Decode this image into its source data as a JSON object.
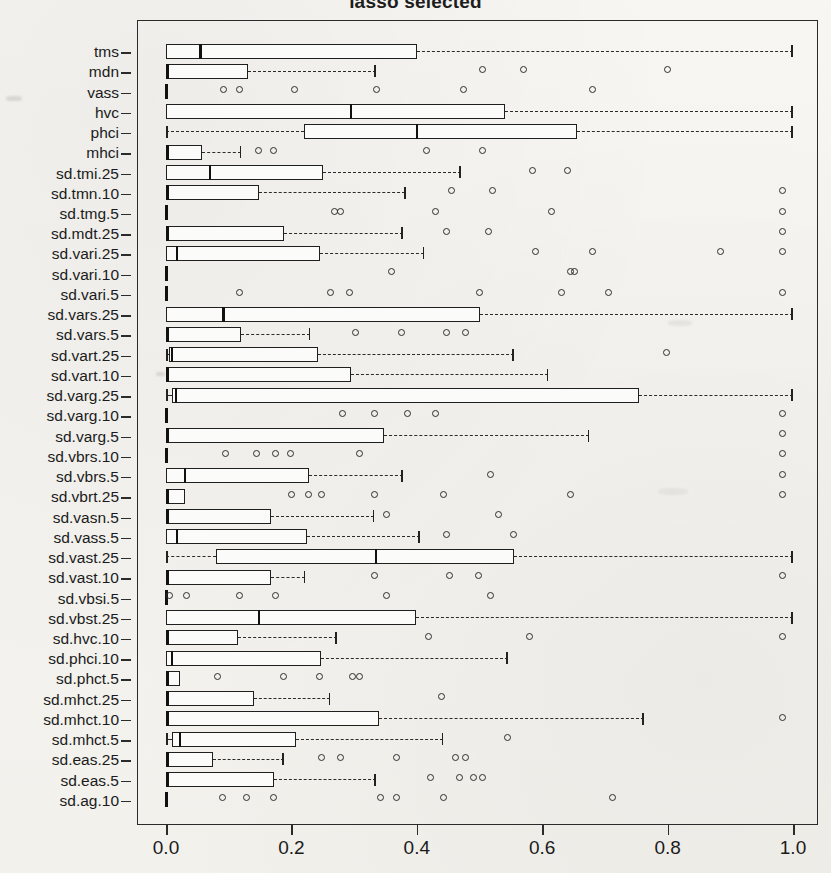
{
  "chart_data": {
    "type": "boxplot",
    "title": "lasso selected",
    "xlabel": "",
    "ylabel": "",
    "xlim": [
      0.0,
      1.0
    ],
    "xticks": [
      0.0,
      0.2,
      0.4,
      0.6,
      0.8,
      1.0
    ],
    "xticklabels": [
      "0.0",
      "0.2",
      "0.4",
      "0.6",
      "0.8",
      "1.0"
    ],
    "orientation": "horizontal",
    "grid": false,
    "legend": null,
    "categories": [
      "tms",
      "mdn",
      "vass",
      "hvc",
      "phci",
      "mhci",
      "sd.tmi.25",
      "sd.tmn.10",
      "sd.tmg.5",
      "sd.mdt.25",
      "sd.vari.25",
      "sd.vari.10",
      "sd.vari.5",
      "sd.vars.25",
      "sd.vars.5",
      "sd.vart.25",
      "sd.vart.10",
      "sd.varg.25",
      "sd.varg.10",
      "sd.varg.5",
      "sd.vbrs.10",
      "sd.vbrs.5",
      "sd.vbrt.25",
      "sd.vasn.5",
      "sd.vass.5",
      "sd.vast.25",
      "sd.vast.10",
      "sd.vbsi.5",
      "sd.vbst.25",
      "sd.hvc.10",
      "sd.phci.10",
      "sd.phct.5",
      "sd.mhct.25",
      "sd.mhct.10",
      "sd.mhct.5",
      "sd.eas.25",
      "sd.eas.5",
      "sd.ag.10"
    ],
    "boxes": [
      {
        "label": "tms",
        "whisker_low": 0.0,
        "q1": 0.0,
        "median": 0.055,
        "q3": 0.4,
        "whisker_high": 1.0,
        "outliers": []
      },
      {
        "label": "mdn",
        "whisker_low": 0.0,
        "q1": 0.0,
        "median": 0.002,
        "q3": 0.13,
        "whisker_high": 0.335,
        "outliers": [
          0.505,
          0.57,
          0.8
        ]
      },
      {
        "label": "vass",
        "whisker_low": 0.0,
        "q1": 0.0,
        "median": 0.0,
        "q3": 0.0,
        "whisker_high": 0.0,
        "outliers": [
          0.092,
          0.118,
          0.205,
          0.335,
          0.475,
          0.68
        ]
      },
      {
        "label": "hvc",
        "whisker_low": 0.0,
        "q1": 0.0,
        "median": 0.295,
        "q3": 0.54,
        "whisker_high": 1.0,
        "outliers": []
      },
      {
        "label": "phci",
        "whisker_low": 0.0,
        "q1": 0.22,
        "median": 0.4,
        "q3": 0.655,
        "whisker_high": 1.0,
        "outliers": []
      },
      {
        "label": "mhci",
        "whisker_low": 0.0,
        "q1": 0.0,
        "median": 0.0,
        "q3": 0.058,
        "whisker_high": 0.12,
        "outliers": [
          0.148,
          0.172,
          0.415,
          0.505
        ]
      },
      {
        "label": "sd.tmi.25",
        "whisker_low": 0.0,
        "q1": 0.0,
        "median": 0.07,
        "q3": 0.25,
        "whisker_high": 0.47,
        "outliers": [
          0.585,
          0.64
        ]
      },
      {
        "label": "sd.tmn.10",
        "whisker_low": 0.0,
        "q1": 0.0,
        "median": 0.002,
        "q3": 0.148,
        "whisker_high": 0.382,
        "outliers": [
          0.455,
          0.52,
          0.983
        ]
      },
      {
        "label": "sd.tmg.5",
        "whisker_low": 0.0,
        "q1": 0.0,
        "median": 0.0,
        "q3": 0.0,
        "whisker_high": 0.0,
        "outliers": [
          0.268,
          0.278,
          0.43,
          0.615,
          0.983
        ]
      },
      {
        "label": "sd.mdt.25",
        "whisker_low": 0.0,
        "q1": 0.0,
        "median": 0.002,
        "q3": 0.188,
        "whisker_high": 0.378,
        "outliers": [
          0.448,
          0.515,
          0.983
        ]
      },
      {
        "label": "sd.vari.25",
        "whisker_low": 0.0,
        "q1": 0.0,
        "median": 0.018,
        "q3": 0.245,
        "whisker_high": 0.412,
        "outliers": [
          0.59,
          0.68,
          0.885,
          0.983
        ]
      },
      {
        "label": "sd.vari.10",
        "whisker_low": 0.0,
        "q1": 0.0,
        "median": 0.0,
        "q3": 0.0,
        "whisker_high": 0.0,
        "outliers": [
          0.36,
          0.645,
          0.652
        ]
      },
      {
        "label": "sd.vari.5",
        "whisker_low": 0.0,
        "q1": 0.0,
        "median": 0.0,
        "q3": 0.0,
        "whisker_high": 0.0,
        "outliers": [
          0.118,
          0.262,
          0.292,
          0.5,
          0.63,
          0.705,
          0.983
        ]
      },
      {
        "label": "sd.vars.25",
        "whisker_low": 0.0,
        "q1": 0.0,
        "median": 0.092,
        "q3": 0.5,
        "whisker_high": 1.0,
        "outliers": []
      },
      {
        "label": "sd.vars.5",
        "whisker_low": 0.0,
        "q1": 0.0,
        "median": 0.002,
        "q3": 0.12,
        "whisker_high": 0.23,
        "outliers": [
          0.302,
          0.375,
          0.448,
          0.478
        ]
      },
      {
        "label": "sd.vart.25",
        "whisker_low": 0.0,
        "q1": 0.005,
        "median": 0.01,
        "q3": 0.242,
        "whisker_high": 0.555,
        "outliers": [
          0.798
        ]
      },
      {
        "label": "sd.vart.10",
        "whisker_low": 0.0,
        "q1": 0.0,
        "median": 0.002,
        "q3": 0.295,
        "whisker_high": 0.61,
        "outliers": []
      },
      {
        "label": "sd.varg.25",
        "whisker_low": 0.0,
        "q1": 0.01,
        "median": 0.016,
        "q3": 0.755,
        "whisker_high": 1.0,
        "outliers": []
      },
      {
        "label": "sd.varg.10",
        "whisker_low": 0.0,
        "q1": 0.0,
        "median": 0.0,
        "q3": 0.0,
        "whisker_high": 0.0,
        "outliers": [
          0.282,
          0.332,
          0.385,
          0.43,
          0.983
        ]
      },
      {
        "label": "sd.varg.5",
        "whisker_low": 0.0,
        "q1": 0.0,
        "median": 0.002,
        "q3": 0.348,
        "whisker_high": 0.675,
        "outliers": [
          0.983
        ]
      },
      {
        "label": "sd.vbrs.10",
        "whisker_low": 0.0,
        "q1": 0.0,
        "median": 0.0,
        "q3": 0.0,
        "whisker_high": 0.0,
        "outliers": [
          0.095,
          0.145,
          0.175,
          0.198,
          0.308,
          0.983
        ]
      },
      {
        "label": "sd.vbrs.5",
        "whisker_low": 0.0,
        "q1": 0.0,
        "median": 0.03,
        "q3": 0.228,
        "whisker_high": 0.378,
        "outliers": [
          0.518,
          0.983
        ]
      },
      {
        "label": "sd.vbrt.25",
        "whisker_low": 0.0,
        "q1": 0.0,
        "median": 0.0,
        "q3": 0.03,
        "whisker_high": 0.03,
        "outliers": [
          0.2,
          0.228,
          0.248,
          0.332,
          0.442,
          0.645,
          0.983
        ]
      },
      {
        "label": "sd.vasn.5",
        "whisker_low": 0.0,
        "q1": 0.0,
        "median": 0.002,
        "q3": 0.168,
        "whisker_high": 0.332,
        "outliers": [
          0.352,
          0.53
        ]
      },
      {
        "label": "sd.vass.5",
        "whisker_low": 0.0,
        "q1": 0.0,
        "median": 0.018,
        "q3": 0.225,
        "whisker_high": 0.405,
        "outliers": [
          0.448,
          0.555
        ]
      },
      {
        "label": "sd.vast.25",
        "whisker_low": 0.0,
        "q1": 0.08,
        "median": 0.335,
        "q3": 0.555,
        "whisker_high": 1.0,
        "outliers": []
      },
      {
        "label": "sd.vast.10",
        "whisker_low": 0.0,
        "q1": 0.0,
        "median": 0.002,
        "q3": 0.168,
        "whisker_high": 0.222,
        "outliers": [
          0.332,
          0.452,
          0.498,
          0.983
        ]
      },
      {
        "label": "sd.vbsi.5",
        "whisker_low": 0.0,
        "q1": 0.0,
        "median": 0.0,
        "q3": 0.0,
        "whisker_high": 0.0,
        "outliers": [
          0.005,
          0.032,
          0.118,
          0.175,
          0.352,
          0.518
        ]
      },
      {
        "label": "sd.vbst.25",
        "whisker_low": 0.0,
        "q1": 0.0,
        "median": 0.148,
        "q3": 0.398,
        "whisker_high": 1.0,
        "outliers": []
      },
      {
        "label": "sd.hvc.10",
        "whisker_low": 0.0,
        "q1": 0.0,
        "median": 0.002,
        "q3": 0.115,
        "whisker_high": 0.272,
        "outliers": [
          0.418,
          0.58,
          0.983
        ]
      },
      {
        "label": "sd.phci.10",
        "whisker_low": 0.0,
        "q1": 0.0,
        "median": 0.01,
        "q3": 0.248,
        "whisker_high": 0.545,
        "outliers": []
      },
      {
        "label": "sd.phct.5",
        "whisker_low": 0.0,
        "q1": 0.0,
        "median": 0.0,
        "q3": 0.022,
        "whisker_high": 0.022,
        "outliers": [
          0.082,
          0.188,
          0.245,
          0.298,
          0.308
        ]
      },
      {
        "label": "sd.mhct.25",
        "whisker_low": 0.0,
        "q1": 0.0,
        "median": 0.002,
        "q3": 0.14,
        "whisker_high": 0.262,
        "outliers": [
          0.44
        ]
      },
      {
        "label": "sd.mhct.10",
        "whisker_low": 0.0,
        "q1": 0.0,
        "median": 0.002,
        "q3": 0.34,
        "whisker_high": 0.762,
        "outliers": [
          0.983
        ]
      },
      {
        "label": "sd.mhct.5",
        "whisker_low": 0.0,
        "q1": 0.01,
        "median": 0.022,
        "q3": 0.208,
        "whisker_high": 0.442,
        "outliers": [
          0.545
        ]
      },
      {
        "label": "sd.eas.25",
        "whisker_low": 0.0,
        "q1": 0.0,
        "median": 0.002,
        "q3": 0.075,
        "whisker_high": 0.188,
        "outliers": [
          0.248,
          0.278,
          0.368,
          0.462,
          0.478
        ]
      },
      {
        "label": "sd.eas.5",
        "whisker_low": 0.0,
        "q1": 0.0,
        "median": 0.002,
        "q3": 0.172,
        "whisker_high": 0.335,
        "outliers": [
          0.422,
          0.468,
          0.49,
          0.505
        ]
      },
      {
        "label": "sd.ag.10",
        "whisker_low": 0.0,
        "q1": 0.0,
        "median": 0.0,
        "q3": 0.0,
        "whisker_high": 0.0,
        "outliers": [
          0.09,
          0.128,
          0.172,
          0.342,
          0.368,
          0.442,
          0.712
        ]
      }
    ]
  },
  "axis": {
    "x_tick_labels": [
      "0.0",
      "0.2",
      "0.4",
      "0.6",
      "0.8",
      "1.0"
    ]
  }
}
